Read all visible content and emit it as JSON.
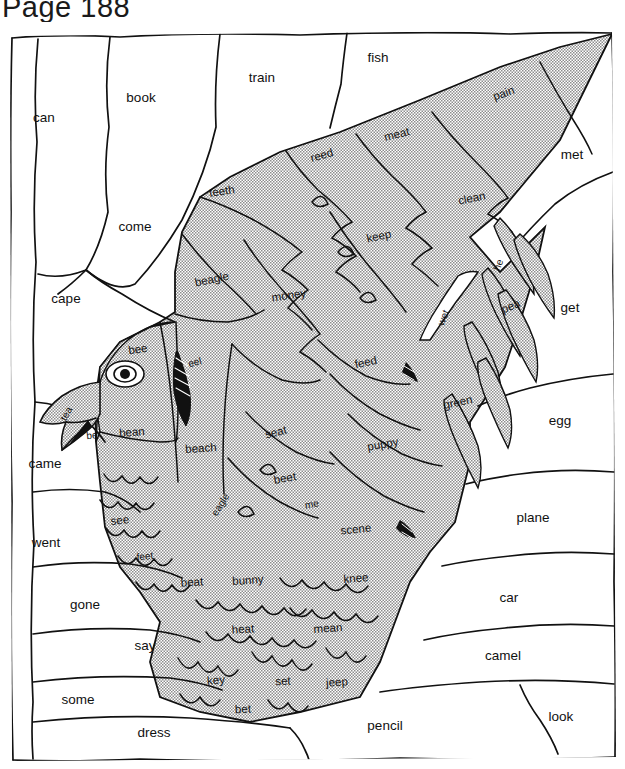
{
  "page": {
    "title": "Page 188",
    "worksheet_type": "hidden-picture word coloring activity",
    "picture_subject": "parrot / bird",
    "colors": {
      "ink": "#111111",
      "shaded_fill": "#b4b4b4",
      "plain_fill": "#ffffff",
      "paper": "#ffffff"
    }
  },
  "regions": {
    "plain": [
      {
        "id": "can",
        "label": "can",
        "x": 44,
        "y": 96,
        "size": "plain"
      },
      {
        "id": "book",
        "label": "book",
        "x": 141,
        "y": 76,
        "size": "plain"
      },
      {
        "id": "train",
        "label": "train",
        "x": 262,
        "y": 56,
        "size": "plain"
      },
      {
        "id": "fish",
        "label": "fish",
        "x": 378,
        "y": 36,
        "size": "plain"
      },
      {
        "id": "met",
        "label": "met",
        "x": 572,
        "y": 133,
        "size": "plain"
      },
      {
        "id": "come",
        "label": "come",
        "x": 135,
        "y": 205,
        "size": "plain"
      },
      {
        "id": "cape",
        "label": "cape",
        "x": 66,
        "y": 277,
        "size": "plain"
      },
      {
        "id": "get",
        "label": "get",
        "x": 570,
        "y": 286,
        "size": "plain"
      },
      {
        "id": "egg",
        "label": "egg",
        "x": 560,
        "y": 399,
        "size": "plain"
      },
      {
        "id": "came",
        "label": "came",
        "x": 45,
        "y": 442,
        "size": "plain"
      },
      {
        "id": "went",
        "label": "went",
        "x": 46,
        "y": 521,
        "size": "plain"
      },
      {
        "id": "plane",
        "label": "plane",
        "x": 533,
        "y": 496,
        "size": "plain"
      },
      {
        "id": "gone",
        "label": "gone",
        "x": 85,
        "y": 583,
        "size": "plain"
      },
      {
        "id": "car",
        "label": "car",
        "x": 509,
        "y": 576,
        "size": "plain"
      },
      {
        "id": "say",
        "label": "say",
        "x": 145,
        "y": 624,
        "size": "plain"
      },
      {
        "id": "camel",
        "label": "camel",
        "x": 503,
        "y": 634,
        "size": "plain"
      },
      {
        "id": "some",
        "label": "some",
        "x": 78,
        "y": 678,
        "size": "plain"
      },
      {
        "id": "look",
        "label": "look",
        "x": 561,
        "y": 695,
        "size": "plain"
      },
      {
        "id": "dress",
        "label": "dress",
        "x": 154,
        "y": 711,
        "size": "plain"
      },
      {
        "id": "pencil",
        "label": "pencil",
        "x": 385,
        "y": 704,
        "size": "plain"
      }
    ],
    "shaded": [
      {
        "id": "pain",
        "label": "pain",
        "x": 504,
        "y": 72,
        "rot": -20,
        "size": "shaded"
      },
      {
        "id": "meat",
        "label": "meat",
        "x": 397,
        "y": 113,
        "rot": -14,
        "size": "shaded"
      },
      {
        "id": "reed",
        "label": "reed",
        "x": 322,
        "y": 134,
        "rot": -16,
        "size": "shaded"
      },
      {
        "id": "teeth",
        "label": "teeth",
        "x": 222,
        "y": 170,
        "rot": -8,
        "size": "shaded"
      },
      {
        "id": "clean",
        "label": "clean",
        "x": 472,
        "y": 177,
        "rot": -12,
        "size": "shaded"
      },
      {
        "id": "keep",
        "label": "keep",
        "x": 379,
        "y": 215,
        "rot": -12,
        "size": "shaded"
      },
      {
        "id": "beagle",
        "label": "beagle",
        "x": 212,
        "y": 258,
        "rot": -12,
        "size": "shaded"
      },
      {
        "id": "money",
        "label": "money",
        "x": 289,
        "y": 274,
        "rot": -8,
        "size": "shaded"
      },
      {
        "id": "he",
        "label": "he",
        "x": 499,
        "y": 243,
        "rot": -70,
        "size": "small"
      },
      {
        "id": "pea",
        "label": "pea",
        "x": 511,
        "y": 285,
        "rot": -22,
        "size": "shaded"
      },
      {
        "id": "wet",
        "label": "wet",
        "x": 444,
        "y": 296,
        "rot": -68,
        "size": "small"
      },
      {
        "id": "bee",
        "label": "bee",
        "x": 138,
        "y": 328,
        "rot": -8,
        "size": "shaded"
      },
      {
        "id": "eel",
        "label": "eel",
        "x": 195,
        "y": 341,
        "rot": -14,
        "size": "small"
      },
      {
        "id": "feed",
        "label": "feed",
        "x": 366,
        "y": 341,
        "rot": -12,
        "size": "shaded"
      },
      {
        "id": "tea",
        "label": "tea",
        "x": 67,
        "y": 392,
        "rot": -62,
        "size": "small"
      },
      {
        "id": "green",
        "label": "green",
        "x": 458,
        "y": 381,
        "rot": -12,
        "size": "shaded"
      },
      {
        "id": "be",
        "label": "be",
        "x": 92,
        "y": 414,
        "rot": -6,
        "size": "small"
      },
      {
        "id": "bean",
        "label": "bean",
        "x": 132,
        "y": 411,
        "rot": -4,
        "size": "shaded"
      },
      {
        "id": "beach",
        "label": "beach",
        "x": 201,
        "y": 427,
        "rot": -4,
        "size": "shaded"
      },
      {
        "id": "seat",
        "label": "seat",
        "x": 276,
        "y": 411,
        "rot": -14,
        "size": "shaded"
      },
      {
        "id": "puppy",
        "label": "puppy",
        "x": 383,
        "y": 423,
        "rot": -10,
        "size": "shaded"
      },
      {
        "id": "beet",
        "label": "beet",
        "x": 285,
        "y": 457,
        "rot": -10,
        "size": "shaded"
      },
      {
        "id": "eagle",
        "label": "eagle",
        "x": 221,
        "y": 483,
        "rot": -58,
        "size": "small"
      },
      {
        "id": "me",
        "label": "me",
        "x": 312,
        "y": 483,
        "rot": -10,
        "size": "small"
      },
      {
        "id": "see",
        "label": "see",
        "x": 120,
        "y": 499,
        "rot": -6,
        "size": "shaded"
      },
      {
        "id": "scene",
        "label": "scene",
        "x": 356,
        "y": 508,
        "rot": -6,
        "size": "shaded"
      },
      {
        "id": "feet",
        "label": "feet",
        "x": 145,
        "y": 535,
        "rot": -6,
        "size": "small"
      },
      {
        "id": "beat",
        "label": "beat",
        "x": 192,
        "y": 561,
        "rot": -4,
        "size": "shaded"
      },
      {
        "id": "bunny",
        "label": "bunny",
        "x": 248,
        "y": 559,
        "rot": -4,
        "size": "shaded"
      },
      {
        "id": "knee",
        "label": "knee",
        "x": 356,
        "y": 557,
        "rot": -4,
        "size": "shaded"
      },
      {
        "id": "heat",
        "label": "heat",
        "x": 243,
        "y": 608,
        "rot": -4,
        "size": "shaded"
      },
      {
        "id": "mean",
        "label": "mean",
        "x": 328,
        "y": 607,
        "rot": -4,
        "size": "shaded"
      },
      {
        "id": "key",
        "label": "key",
        "x": 216,
        "y": 659,
        "rot": -4,
        "size": "shaded"
      },
      {
        "id": "set",
        "label": "set",
        "x": 283,
        "y": 660,
        "rot": -2,
        "size": "shaded"
      },
      {
        "id": "jeep",
        "label": "jeep",
        "x": 337,
        "y": 661,
        "rot": -4,
        "size": "shaded"
      },
      {
        "id": "bet",
        "label": "bet",
        "x": 243,
        "y": 688,
        "rot": -2,
        "size": "shaded"
      }
    ]
  }
}
